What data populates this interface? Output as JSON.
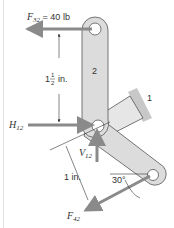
{
  "diagram": {
    "labels": {
      "f32_symbol": "F",
      "f32_sub": "32",
      "f32_value": " = 40 lb",
      "dim_whole": "1",
      "dim_num": "1",
      "dim_den": "2",
      "dim_unit": "in.",
      "link2": "2",
      "link1": "1",
      "h12_symbol": "H",
      "h12_sub": "12",
      "v12_symbol": "V",
      "v12_sub": "12",
      "dim2": "1 in.",
      "angle": "30°",
      "f42_symbol": "F",
      "f42_sub": "42"
    },
    "colors": {
      "link_fill": "#dcdcdc",
      "link_stroke": "#555555",
      "force_arrow": "#8a8a8a",
      "ground": "#c8c8c8"
    }
  }
}
